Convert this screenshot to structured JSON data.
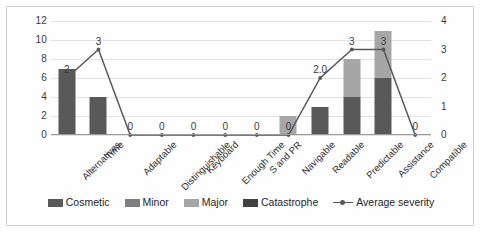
{
  "chart_data": {
    "type": "bar",
    "title": "",
    "xlabel": "",
    "ylabel": "",
    "categories": [
      "Alternatives",
      "Time",
      "Adaptable",
      "Distinguishable",
      "Keyboard",
      "Enough Time",
      "S and PR",
      "Navigable",
      "Readable",
      "Predictable",
      "Assistance",
      "Compatible"
    ],
    "ylim": [
      0,
      12
    ],
    "y_ticks": [
      "0",
      "2",
      "4",
      "6",
      "8",
      "10",
      "12"
    ],
    "secondary_ylim": [
      0,
      4
    ],
    "secondary_y_ticks": [
      "0",
      "1",
      "2",
      "3",
      "4"
    ],
    "grid": true,
    "legend_position": "bottom",
    "series": [
      {
        "name": "Cosmetic",
        "color": "#595959",
        "values": [
          7,
          4,
          0,
          0,
          0,
          0,
          0,
          0,
          3,
          4,
          6,
          0
        ]
      },
      {
        "name": "Minor",
        "color": "#7e7e7e",
        "values": [
          0,
          0,
          0,
          0,
          0,
          0,
          0,
          0,
          0,
          0,
          0,
          0
        ]
      },
      {
        "name": "Major",
        "color": "#a6a6a6",
        "values": [
          0,
          0,
          0,
          0,
          0,
          0,
          0,
          2,
          0,
          4,
          5,
          0
        ]
      },
      {
        "name": "Catastrophe",
        "color": "#404040",
        "values": [
          0,
          0,
          0,
          0,
          0,
          0,
          0,
          0,
          0,
          0,
          0,
          0
        ]
      }
    ],
    "line_series": {
      "name": "Average severity",
      "color": "#595959",
      "axis": "secondary",
      "values": [
        2,
        3,
        0,
        0,
        0,
        0,
        0,
        0,
        2.0,
        3,
        3,
        0
      ],
      "labels": [
        "2",
        "3",
        "0",
        "0",
        "0",
        "0",
        "0",
        "0",
        "2.0",
        "3",
        "3",
        "0"
      ]
    }
  },
  "legend": {
    "items": [
      {
        "label": "Cosmetic",
        "swatch": "legend-swatch-cosmetic"
      },
      {
        "label": "Minor",
        "swatch": "legend-swatch-minor"
      },
      {
        "label": "Major",
        "swatch": "legend-swatch-major"
      },
      {
        "label": "Catastrophe",
        "swatch": "legend-swatch-catastrophe"
      },
      {
        "label": "Average severity",
        "swatch": "legend-line-average-severity"
      }
    ]
  }
}
